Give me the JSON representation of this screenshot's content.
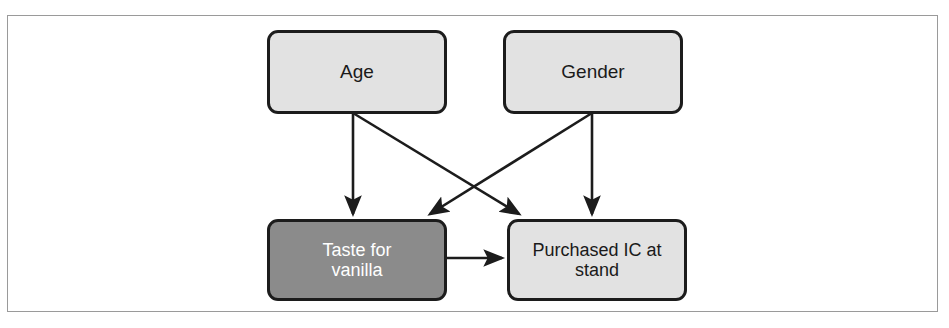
{
  "figure": {
    "type": "causal-diagram",
    "border_color": "#9a9a9a",
    "background": "#ffffff"
  },
  "diagram": {
    "nodes": [
      {
        "id": "age",
        "label": "Age",
        "fill": "#e2e2e2",
        "text_color": "#1a1a1a",
        "border_color": "#1c1c1c",
        "shape": "rounded-rectangle",
        "x": 267,
        "y": 30,
        "width": 180,
        "height": 84
      },
      {
        "id": "gender",
        "label": "Gender",
        "fill": "#e2e2e2",
        "text_color": "#1a1a1a",
        "border_color": "#1c1c1c",
        "shape": "rounded-rectangle",
        "x": 503,
        "y": 30,
        "width": 180,
        "height": 84
      },
      {
        "id": "taste",
        "label": "Taste for\nvanilla",
        "fill": "#8b8b8b",
        "text_color": "#ffffff",
        "border_color": "#1c1c1c",
        "shape": "rounded-rectangle",
        "x": 267,
        "y": 219,
        "width": 180,
        "height": 82
      },
      {
        "id": "purchased",
        "label": "Purchased IC at\nstand",
        "fill": "#e2e2e2",
        "text_color": "#1a1a1a",
        "border_color": "#1c1c1c",
        "shape": "rounded-rectangle",
        "x": 507,
        "y": 219,
        "width": 180,
        "height": 82
      }
    ],
    "edges": [
      {
        "id": "age-to-taste",
        "from": "age",
        "to": "taste",
        "style": "solid-arrow",
        "color": "#1c1c1c",
        "x1": 353,
        "y1": 113,
        "x2": 353,
        "y2": 216
      },
      {
        "id": "age-to-purchased",
        "from": "age",
        "to": "purchased",
        "style": "solid-arrow",
        "color": "#1c1c1c",
        "x1": 353,
        "y1": 113,
        "x2": 521,
        "y2": 216
      },
      {
        "id": "gender-to-taste",
        "from": "gender",
        "to": "taste",
        "style": "solid-arrow",
        "color": "#1c1c1c",
        "x1": 592,
        "y1": 113,
        "x2": 428,
        "y2": 216
      },
      {
        "id": "gender-to-purchased",
        "from": "gender",
        "to": "purchased",
        "style": "solid-arrow",
        "color": "#1c1c1c",
        "x1": 592,
        "y1": 113,
        "x2": 592,
        "y2": 216
      },
      {
        "id": "taste-to-purchased",
        "from": "taste",
        "to": "purchased",
        "style": "solid-arrow",
        "color": "#1c1c1c",
        "x1": 447,
        "y1": 258,
        "x2": 504,
        "y2": 258
      }
    ]
  }
}
